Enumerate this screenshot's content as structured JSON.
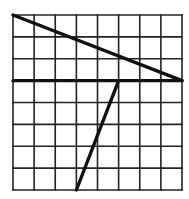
{
  "diagram": {
    "type": "grid-with-line-segments",
    "grid": {
      "columns": 8,
      "rows": 8,
      "origin_px": [
        13,
        15
      ],
      "size_px": [
        169,
        175
      ],
      "line_color": "#222222",
      "background": "#ffffff"
    },
    "segments": [
      {
        "name": "top-diagonal",
        "from": [
          0,
          0
        ],
        "to": [
          8,
          3
        ],
        "color": "#111111"
      },
      {
        "name": "horizontal-line",
        "from": [
          0,
          3
        ],
        "to": [
          8,
          3
        ],
        "color": "#111111"
      },
      {
        "name": "lower-diagonal",
        "from": [
          5,
          3
        ],
        "to": [
          3,
          8
        ],
        "color": "#111111"
      }
    ]
  }
}
